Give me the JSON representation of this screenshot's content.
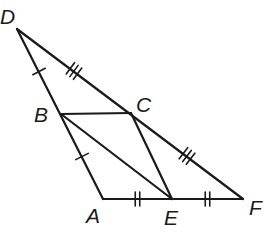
{
  "diagram": {
    "type": "geometry-figure",
    "stroke_color": "#1a1a1a",
    "background": "#ffffff",
    "points": {
      "D": {
        "label": "D",
        "x": 17,
        "y": 29
      },
      "B": {
        "label": "B",
        "x": 61,
        "y": 114
      },
      "A": {
        "label": "A",
        "x": 103,
        "y": 199
      },
      "C": {
        "label": "C",
        "x": 131,
        "y": 113
      },
      "E": {
        "label": "E",
        "x": 172,
        "y": 199
      },
      "F": {
        "label": "F",
        "x": 243,
        "y": 199
      }
    },
    "segments": [
      [
        "D",
        "A"
      ],
      [
        "D",
        "F"
      ],
      [
        "A",
        "F"
      ],
      [
        "B",
        "C"
      ],
      [
        "B",
        "E"
      ],
      [
        "C",
        "E"
      ]
    ],
    "congruence_marks": [
      {
        "segment": [
          "D",
          "B"
        ],
        "ticks": 1
      },
      {
        "segment": [
          "B",
          "A"
        ],
        "ticks": 1
      },
      {
        "segment": [
          "D",
          "C"
        ],
        "ticks": 3
      },
      {
        "segment": [
          "C",
          "F"
        ],
        "ticks": 3
      },
      {
        "segment": [
          "A",
          "E"
        ],
        "ticks": 2
      },
      {
        "segment": [
          "E",
          "F"
        ],
        "ticks": 2
      }
    ]
  }
}
